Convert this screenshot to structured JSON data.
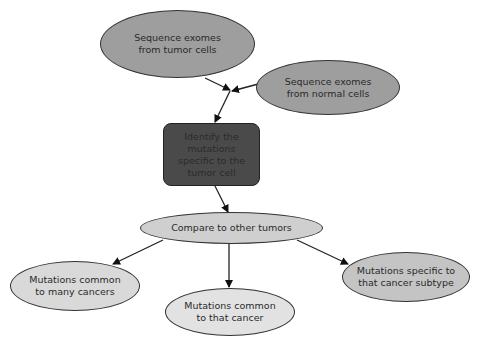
{
  "diagram": {
    "type": "flowchart",
    "nodes": {
      "tumor": {
        "label": "Sequence exomes from tumor cells",
        "fill": "#9e9e9e"
      },
      "normal": {
        "label": "Sequence exomes from normal cells",
        "fill": "#9e9e9e"
      },
      "identify": {
        "label": "Identify the mutations specific to the tumor cell",
        "fill": "#4a4a4a"
      },
      "compare": {
        "label": "Compare to other tumors",
        "fill": "#cfcfcf"
      },
      "many": {
        "label": "Mutations common to many cancers",
        "fill": "#d9d9d9"
      },
      "that": {
        "label": "Mutations common to that cancer",
        "fill": "#e2e2e2"
      },
      "subtype": {
        "label": "Mutations specific to that cancer subtype",
        "fill": "#c4c4c4"
      }
    },
    "edges": [
      {
        "from": "tumor",
        "to": "identify"
      },
      {
        "from": "normal",
        "to": "identify"
      },
      {
        "from": "identify",
        "to": "compare"
      },
      {
        "from": "compare",
        "to": "many"
      },
      {
        "from": "compare",
        "to": "that"
      },
      {
        "from": "compare",
        "to": "subtype"
      }
    ]
  }
}
